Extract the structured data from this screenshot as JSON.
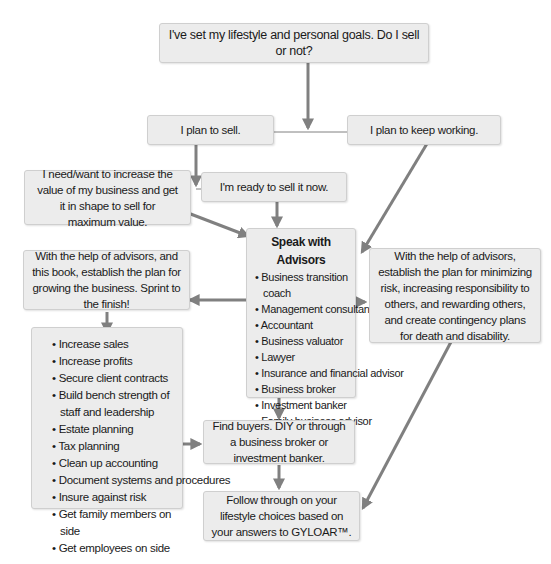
{
  "diagram": {
    "start": "I've set my lifestyle and personal goals. Do I sell or not?",
    "plan_sell": "I plan to sell.",
    "plan_keep": "I plan to keep working.",
    "increase_value": "I need/want to increase the value of my business and get it in shape to sell for maximum value.",
    "ready_now": "I'm ready to sell it now.",
    "advisors": {
      "title": "Speak with Advisors",
      "items": [
        "Business transition coach",
        "Management consultant/coach",
        "Accountant",
        "Business valuator",
        "Lawyer",
        "Insurance and financial advisor",
        "Business broker",
        "Investment banker",
        "Family business advisor"
      ]
    },
    "grow_plan": "With the help of advisors, and this book, establish the plan for growing the business. Sprint to the finish!",
    "risk_plan": "With the help of advisors, establish the plan for minimizing risk, increasing responsibility to others, and rewarding others, and create contingency plans for death and disability.",
    "grow_tasks": [
      "Increase sales",
      "Increase profits",
      "Secure client contracts",
      "Build bench strength of staff and leadership",
      "Estate planning",
      "Tax planning",
      "Clean up accounting",
      "Document systems and procedures",
      "Insure against risk",
      "Get family members on side",
      "Get employees on side"
    ],
    "find_buyers": "Find buyers. DIY or through a business broker or investment banker.",
    "follow_through": "Follow through on your lifestyle choices based on your answers to GYLOAR™."
  },
  "colors": {
    "box_fill": "#ececec",
    "box_border": "#cfcfcf",
    "arrow": "#808080"
  }
}
